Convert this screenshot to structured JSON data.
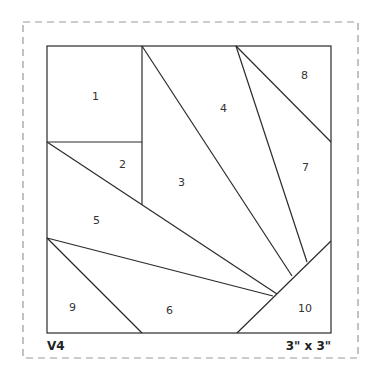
{
  "diagram": {
    "type": "foundation-paper-piecing-pattern",
    "version_label": "V4",
    "size_label": "3\" x 3\"",
    "pieces": [
      {
        "id": "1",
        "label": "1"
      },
      {
        "id": "2",
        "label": "2"
      },
      {
        "id": "3",
        "label": "3"
      },
      {
        "id": "4",
        "label": "4"
      },
      {
        "id": "5",
        "label": "5"
      },
      {
        "id": "6",
        "label": "6"
      },
      {
        "id": "7",
        "label": "7"
      },
      {
        "id": "8",
        "label": "8"
      },
      {
        "id": "9",
        "label": "9"
      },
      {
        "id": "10",
        "label": "10"
      }
    ],
    "colors": {
      "line": "#2a2a2a",
      "dashed_border": "#9a9a9a",
      "background": "#ffffff"
    }
  }
}
